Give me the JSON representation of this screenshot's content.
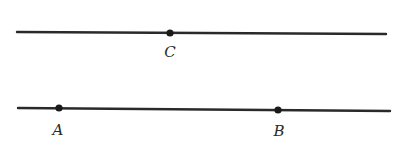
{
  "diagram": {
    "lines": [
      {
        "id": "line-top",
        "x1": 17,
        "y1": 32,
        "x2": 386,
        "y2": 34
      },
      {
        "id": "line-bottom",
        "x1": 18,
        "y1": 108,
        "x2": 390,
        "y2": 111
      }
    ],
    "points": [
      {
        "id": "C",
        "label": "C",
        "x": 170,
        "y": 33,
        "label_x": 170,
        "label_y": 57
      },
      {
        "id": "A",
        "label": "A",
        "x": 59,
        "y": 108,
        "label_x": 58,
        "label_y": 135
      },
      {
        "id": "B",
        "label": "B",
        "x": 278,
        "y": 110,
        "label_x": 279,
        "label_y": 136
      }
    ],
    "colors": {
      "stroke": "#2a2a2a",
      "point": "#1a1a1a",
      "background": "#ffffff"
    }
  }
}
